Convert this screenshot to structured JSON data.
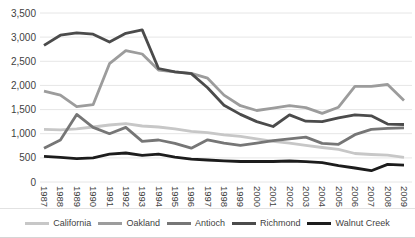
{
  "chart_data": {
    "type": "line",
    "title": "",
    "xlabel": "",
    "ylabel": "",
    "grid": true,
    "legend_position": "bottom",
    "ylim": [
      0,
      3500
    ],
    "y_ticks": [
      "0",
      "500",
      "1,000",
      "1,500",
      "2,000",
      "2,500",
      "3,000",
      "3,500"
    ],
    "x": [
      "1987",
      "1988",
      "1989",
      "1990",
      "1991",
      "1992",
      "1993",
      "1994",
      "1995",
      "1996",
      "1997",
      "1998",
      "1999",
      "2000",
      "2001",
      "2002",
      "2003",
      "2004",
      "2005",
      "2006",
      "2007",
      "2008",
      "2009"
    ],
    "series": [
      {
        "name": "California",
        "color": "#c7c7c7",
        "values": [
          1090,
          1080,
          1100,
          1140,
          1180,
          1210,
          1160,
          1140,
          1100,
          1050,
          1020,
          975,
          945,
          895,
          840,
          805,
          760,
          715,
          675,
          590,
          570,
          555,
          510
        ]
      },
      {
        "name": "Oakland",
        "color": "#9c9c9c",
        "values": [
          1880,
          1800,
          1560,
          1600,
          2450,
          2720,
          2650,
          2320,
          2280,
          2250,
          2150,
          1800,
          1580,
          1480,
          1530,
          1580,
          1540,
          1420,
          1550,
          1980,
          1980,
          2020,
          1690
        ]
      },
      {
        "name": "Antioch",
        "color": "#767676",
        "values": [
          700,
          870,
          1400,
          1130,
          1000,
          1130,
          840,
          870,
          800,
          700,
          875,
          805,
          760,
          805,
          855,
          895,
          930,
          800,
          780,
          980,
          1090,
          1110,
          1120
        ]
      },
      {
        "name": "Richmond",
        "color": "#4b4b4b",
        "values": [
          2830,
          3040,
          3090,
          3060,
          2900,
          3080,
          3150,
          2350,
          2280,
          2245,
          1950,
          1590,
          1400,
          1250,
          1150,
          1390,
          1260,
          1250,
          1330,
          1390,
          1370,
          1200,
          1190
        ]
      },
      {
        "name": "Walnut Creek",
        "color": "#1c1c1c",
        "values": [
          530,
          510,
          485,
          500,
          575,
          600,
          550,
          575,
          515,
          475,
          455,
          440,
          425,
          425,
          425,
          435,
          420,
          400,
          340,
          290,
          235,
          365,
          350
        ]
      }
    ]
  },
  "colors": {
    "background": "#ffffff",
    "gridline": "#e6e6e6",
    "axis_text": "#3f3f3f",
    "separator": "#dcdcdc"
  }
}
